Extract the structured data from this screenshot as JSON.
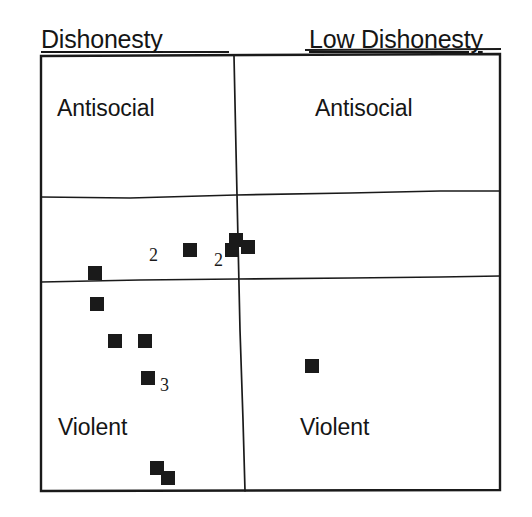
{
  "figure": {
    "type": "scatter-quadrant-diagram",
    "width": 532,
    "height": 517,
    "background_color": "#ffffff",
    "ink_color": "#1a1a1a"
  },
  "headers": {
    "left": "Dishonesty",
    "right": "Low Dishonesty"
  },
  "quadrant_labels": {
    "top_left": "Antisocial",
    "top_right": "Antisocial",
    "bottom_left": "Violent",
    "bottom_right": "Violent"
  },
  "count_annotations": [
    {
      "label": "2",
      "x": 152,
      "y": 255
    },
    {
      "label": "2",
      "x": 218,
      "y": 260
    },
    {
      "label": "3",
      "x": 165,
      "y": 385
    }
  ],
  "chart_data": {
    "type": "scatter",
    "title": "",
    "xlabel": "",
    "ylabel": "",
    "grid": false,
    "legend": false,
    "axis_note": "Horizontal axis runs from Dishonesty (left) to Low Dishonesty (right); vertical axis runs from Antisocial (top) to Violent (bottom).",
    "frame": {
      "left": 40,
      "top": 55,
      "right": 500,
      "bottom": 491
    },
    "dividers": {
      "vertical": {
        "x_top": 234,
        "x_bottom": 245
      },
      "horizontal_upper": {
        "y_left": 196,
        "y_right": 192
      },
      "horizontal_lower": {
        "y_left": 280,
        "y_right": 278
      }
    },
    "marker": {
      "shape": "square",
      "size": 14,
      "color": "#1a1a1a"
    },
    "points": [
      {
        "x": 190,
        "y": 250,
        "count": 2,
        "region": "middle-band-left"
      },
      {
        "x": 236,
        "y": 240,
        "count": 1,
        "region": "middle-band-center"
      },
      {
        "x": 248,
        "y": 247,
        "count": 1,
        "region": "middle-band-center"
      },
      {
        "x": 232,
        "y": 250,
        "count": 2,
        "region": "middle-band-center"
      },
      {
        "x": 95,
        "y": 273,
        "count": 1,
        "region": "middle-band-far-left"
      },
      {
        "x": 97,
        "y": 304,
        "count": 1,
        "region": "violent-left"
      },
      {
        "x": 115,
        "y": 341,
        "count": 1,
        "region": "violent-left"
      },
      {
        "x": 145,
        "y": 341,
        "count": 1,
        "region": "violent-left"
      },
      {
        "x": 148,
        "y": 378,
        "count": 3,
        "region": "violent-left"
      },
      {
        "x": 312,
        "y": 366,
        "count": 1,
        "region": "violent-right"
      },
      {
        "x": 157,
        "y": 468,
        "count": 1,
        "region": "violent-left-bottom"
      },
      {
        "x": 168,
        "y": 478,
        "count": 1,
        "region": "violent-left-bottom"
      }
    ],
    "total_marker_glyphs": 12,
    "total_cases_with_counts": 16
  }
}
